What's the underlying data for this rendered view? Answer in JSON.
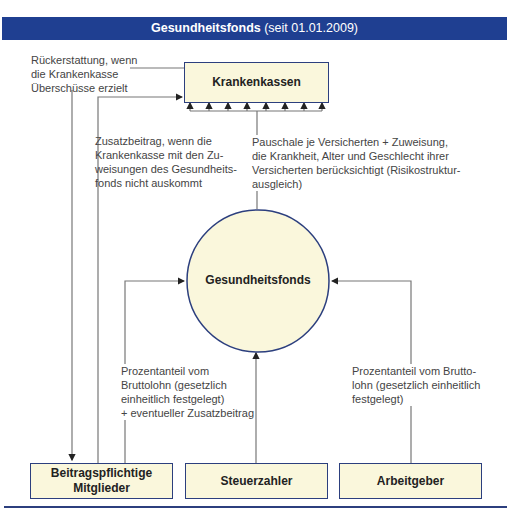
{
  "header": {
    "title_bold": "Gesundheitsfonds",
    "title_rest": " (seit 01.01.2009)",
    "color": "#1f3f91"
  },
  "nodes": {
    "krankenkassen": "Krankenkassen",
    "gesundheitsfonds": "Gesundheitsfonds",
    "mitglieder_line1": "Beitragspflichtige",
    "mitglieder_line2": "Mitglieder",
    "steuerzahler": "Steuerzahler",
    "arbeitgeber": "Arbeitgeber"
  },
  "edges": {
    "rueckerstattung": [
      "Rückerstattung, wenn",
      "die Krankenkasse",
      "Überschüsse erzielt"
    ],
    "zusatzbeitrag": [
      "Zusatzbeitrag, wenn die",
      "Krankenkasse mit den Zu-",
      "weisungen des Gesundheits-",
      "fonds nicht auskommt"
    ],
    "pauschale": [
      "Pauschale je Versicherten + Zuweisung,",
      "die Krankheit, Alter und Geschlecht ihrer",
      "Versicherten berücksichtigt (Risikostruktur-",
      "ausgleich)"
    ],
    "mitglieder_beitrag": [
      "Prozentanteil vom",
      "Bruttolohn (gesetzlich",
      "einheitlich festgelegt)",
      "+ eventueller Zusatzbeitrag"
    ],
    "arbeitgeber_beitrag": [
      "Prozentanteil vom Brutto-",
      "lohn (gesetzlich einheitlich",
      "festgelegt)"
    ]
  },
  "colors": {
    "box_fill": "#faf7dc",
    "box_border": "#2c3f7e",
    "line": "#777777"
  }
}
